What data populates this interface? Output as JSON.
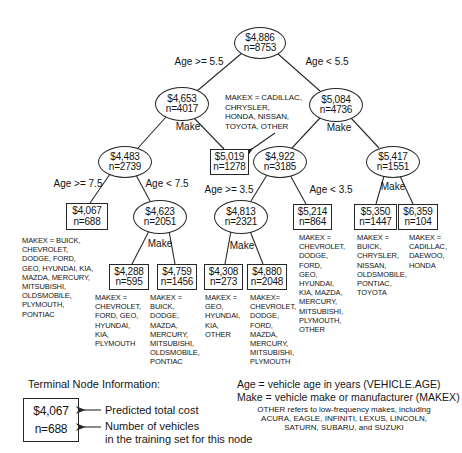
{
  "colors": {
    "ink": "#161616",
    "line": "#2a2a2a",
    "background": "#ffffff"
  },
  "tree": {
    "nodes": [
      {
        "value": "$4,886",
        "n": "n=8753"
      },
      {
        "value": "$4,653",
        "n": "n=4017"
      },
      {
        "value": "$5,084",
        "n": "n=4736"
      },
      {
        "value": "$4,483",
        "n": "n=2739"
      },
      {
        "value": "$5,019",
        "n": "n=1278"
      },
      {
        "value": "$4,922",
        "n": "n=3185"
      },
      {
        "value": "$5,417",
        "n": "n=1551"
      },
      {
        "value": "$4,067",
        "n": "n=688"
      },
      {
        "value": "$4,623",
        "n": "n=2051"
      },
      {
        "value": "$4,813",
        "n": "n=2321"
      },
      {
        "value": "$5,214",
        "n": "n=864"
      },
      {
        "value": "$5,350",
        "n": "n=1447"
      },
      {
        "value": "$6,359",
        "n": "n=104"
      },
      {
        "value": "$4,288",
        "n": "n=595"
      },
      {
        "value": "$4,759",
        "n": "n=1456"
      },
      {
        "value": "$4,308",
        "n": "n=273"
      },
      {
        "value": "$4,880",
        "n": "n=2048"
      }
    ],
    "branch_labels": [
      "Age >= 5.5",
      "Age < 5.5",
      "Age >= 7.5",
      "Age < 7.5",
      "Age >= 3.5",
      "Age < 3.5"
    ],
    "split_labels": [
      "Make",
      "Make",
      "Make",
      "Make",
      "Make"
    ],
    "annotation": "MAKEX = CADILLAC,\nCHRYSLER,\nHONDA, NISSAN,\nTOYOTA, OTHER",
    "make_lists": [
      "MAKEX = BUICK,\nCHEVROLET,\nDODGE, FORD,\nGEO, HYUNDAI, KIA,\nMAZDA, MERCURY,\nMITSUBISHI,\nOLDSMOBILE,\nPLYMOUTH,\nPONTIAC",
      "MAKEX =\nCHEVROLET,\nFORD, GEO,\nHYUNDAI,\nKIA,\nPLYMOUTH",
      "MAKEX =\nBUICK,\nDODGE,\nMAZDA,\nMERCURY,\nMITSUBISHI,\nOLDSMOBILE,\nPONTIAC",
      "MAKEX =\nGEO,\nHYUNDAI,\nKIA,\nOTHER",
      "MAKEX=\nCHEVROLET,\nDODGE,\nFORD,\nMAZDA,\nMERCURY,\nMITSUBISHI,\nPLYMOUTH",
      "MAKEX =\nCHEVROLET,\nDODGE,\nFORD,\nGEO,\nHYUNDAI,\nKIA, MAZDA,\nMERCURY,\nMITSUBISHI,\nPLYMOUTH,\nOTHER",
      "MAKEX =\nBUICK,\nCHRYSLER,\nNISSAN,\nOLDSMOBILE,\nPONTIAC,\nTOYOTA",
      "MAKEX =\nCADILLAC,\nDAEWOO,\nHONDA"
    ]
  },
  "legend": {
    "title": "Terminal Node Information:",
    "example_value": "$4,067",
    "example_n": "n=688",
    "caption_value": "Predicted total cost",
    "caption_n": "Number of vehicles\nin the training set for this node",
    "def_age": "Age = vehicle age in years (VEHICLE.AGE)",
    "def_make": "Make = vehicle make or manufacturer (MAKEX)",
    "other_note": "OTHER refers to low-frequency makes, including\nACURA, EAGLE, INFINITI, LEXUS, LINCOLN,\nSATURN, SUBARU, and SUZUKI"
  }
}
